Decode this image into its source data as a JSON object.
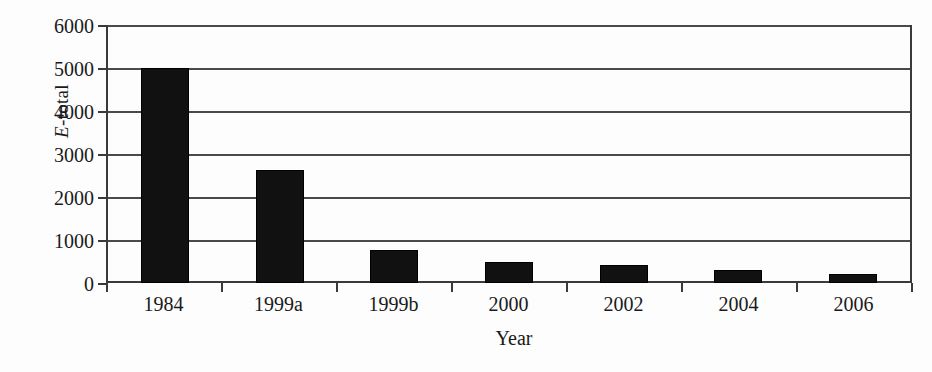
{
  "chart_data": {
    "type": "bar",
    "title": "",
    "subtitle": "",
    "xlabel": "Year",
    "ylabel": "E-total",
    "ylabel_italic_prefix": "E",
    "ylabel_rest": "-total",
    "categories": [
      "1984",
      "1999a",
      "1999b",
      "2000",
      "2002",
      "2004",
      "2006"
    ],
    "values": [
      5000,
      2620,
      770,
      480,
      430,
      310,
      210
    ],
    "series": [
      {
        "name": "E-total",
        "values": [
          5000,
          2620,
          770,
          480,
          430,
          310,
          210
        ]
      }
    ],
    "ylim": [
      0,
      6000
    ],
    "ytick_values": [
      0,
      1000,
      2000,
      3000,
      4000,
      5000,
      6000
    ],
    "ytick_labels": [
      "0",
      "1000",
      "2000",
      "3000",
      "4000",
      "5000",
      "6000"
    ],
    "grid": true,
    "grid_axis": "y",
    "legend": false,
    "legend_position": "none",
    "bar_color": "#111111",
    "axis_color": "#3a3a3a",
    "grid_color": "#4a4a4a",
    "background_color": "#fdfdfd"
  }
}
